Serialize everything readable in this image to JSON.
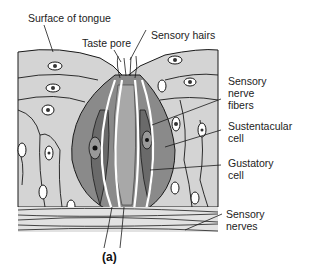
{
  "diagram": {
    "type": "anatomical-illustration",
    "caption": "(a)",
    "labels": {
      "surface_of_tongue": "Surface of tongue",
      "taste_pore": "Taste pore",
      "sensory_hairs": "Sensory hairs",
      "sensory_nerve_fibers_1": "Sensory",
      "sensory_nerve_fibers_2": "nerve",
      "sensory_nerve_fibers_3": "fibers",
      "sustentacular_cell_1": "Sustentacular",
      "sustentacular_cell_2": "cell",
      "gustatory_cell_1": "Gustatory",
      "gustatory_cell_2": "cell",
      "sensory_nerves_1": "Sensory",
      "sensory_nerves_2": "nerves"
    },
    "colors": {
      "epithelium": "#d4d4d4",
      "taste_bud_outer": "#8a8a8a",
      "gustatory_cell": "#7a7a7a",
      "outline": "#1a1a1a",
      "background": "#ffffff"
    }
  }
}
